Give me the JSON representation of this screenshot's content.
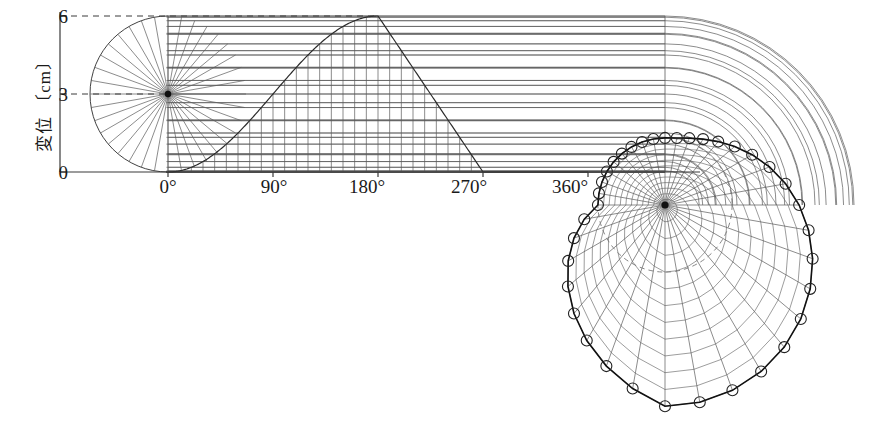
{
  "figure": {
    "title": "",
    "background_color": "#ffffff",
    "line_color": "#5a5a5a",
    "curve_color": "#2b2b2b",
    "axis_color": "#3a3a3a"
  },
  "axes": {
    "y_label": "変位 〔cm〕",
    "y_label_unit": "cm",
    "y_ticks": [
      {
        "value": 0,
        "label": "0"
      },
      {
        "value": 3,
        "label": "3"
      },
      {
        "value": 6,
        "label": "6"
      }
    ],
    "x_ticks": [
      {
        "value": 0,
        "label": "0°"
      },
      {
        "value": 90,
        "label": "90°"
      },
      {
        "value": 180,
        "label": "180°"
      },
      {
        "value": 270,
        "label": "270°"
      },
      {
        "value": 360,
        "label": "360°"
      }
    ],
    "x_min": 0,
    "x_max": 450,
    "y_min": 0,
    "y_max": 6
  },
  "chart_data": {
    "type": "line",
    "title": "",
    "xlabel": "",
    "ylabel": "変位 〔cm〕",
    "xlim": [
      0,
      450
    ],
    "ylim": [
      0,
      6
    ],
    "grid": true,
    "legend": "none",
    "series": [
      {
        "name": "displacement-profile",
        "description": "rise 0-180 deg (versine 3(1-cos)), linear fall 180-270 deg, dwell 270-450 deg",
        "x": [
          0,
          10,
          20,
          30,
          40,
          50,
          60,
          70,
          80,
          90,
          100,
          110,
          120,
          130,
          140,
          150,
          160,
          170,
          180,
          190,
          200,
          210,
          220,
          230,
          240,
          250,
          260,
          270,
          280,
          300,
          330,
          360,
          400,
          450
        ],
        "y": [
          0.0,
          0.05,
          0.18,
          0.4,
          0.7,
          1.07,
          1.5,
          1.97,
          2.48,
          3.0,
          3.52,
          4.03,
          4.5,
          4.93,
          5.3,
          5.6,
          5.82,
          5.95,
          6.0,
          5.33,
          4.67,
          4.0,
          3.33,
          2.67,
          2.0,
          1.33,
          0.67,
          0.0,
          0.0,
          0.0,
          0.0,
          0.0,
          0.0,
          0.0
        ]
      }
    ],
    "markers": {
      "count": 36,
      "shape": "open-circle",
      "on": "polar-cam-profile"
    }
  },
  "polar": {
    "name": "cam-profile-polar",
    "shape": "limacon-cardioid",
    "center_label": "cam-center",
    "base_radius_cm": 3,
    "max_radius_cm": 6,
    "spoke_count": 36,
    "ring_count": 12,
    "marker_count": 36,
    "start_angle_deg": 90,
    "rotation": "clockwise"
  },
  "elements": {
    "left_semicircle": "base-circle-semicircle",
    "radial_spokes": "radial-construction-lines",
    "horizontal_transfer_lines": "displacement-transfer-lines",
    "vertical_division_lines": "angle-division-lines",
    "dashed_top_line": "max-displacement-guide",
    "wrap_arcs": "transfer-arcs-to-polar",
    "center_dot": "construction-center-dot"
  }
}
